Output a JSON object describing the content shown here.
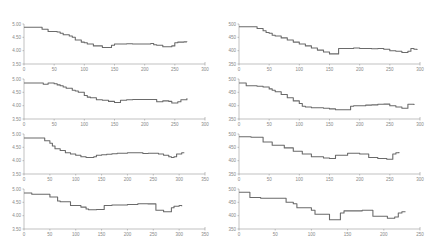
{
  "chart_data": [
    {
      "type": "line",
      "title": "",
      "xlabel": "",
      "ylabel": "",
      "xlim": [
        0,
        300
      ],
      "ylim": [
        3.5,
        5.0
      ],
      "xticks": [
        "0",
        "50",
        "100",
        "150",
        "200",
        "250",
        "300"
      ],
      "yticks": [
        "5.00",
        "4.50",
        "4.00",
        "3.50"
      ],
      "grid": false,
      "series": [
        {
          "name": "series",
          "x": [
            0,
            10,
            20,
            25,
            30,
            35,
            40,
            50,
            55,
            60,
            65,
            70,
            75,
            80,
            85,
            90,
            95,
            100,
            105,
            110,
            115,
            120,
            130,
            140,
            145,
            150,
            155,
            160,
            170,
            180,
            190,
            200,
            210,
            215,
            220,
            225,
            230,
            240,
            245,
            250,
            255,
            260,
            265,
            270
          ],
          "y": [
            4.88,
            4.88,
            4.88,
            4.88,
            4.8,
            4.8,
            4.72,
            4.72,
            4.7,
            4.65,
            4.6,
            4.6,
            4.55,
            4.5,
            4.4,
            4.4,
            4.32,
            4.3,
            4.25,
            4.25,
            4.18,
            4.18,
            4.12,
            4.12,
            4.2,
            4.25,
            4.25,
            4.25,
            4.26,
            4.25,
            4.25,
            4.25,
            4.27,
            4.22,
            4.2,
            4.2,
            4.15,
            4.15,
            4.18,
            4.3,
            4.32,
            4.32,
            4.33,
            4.32
          ]
        }
      ]
    },
    {
      "type": "line",
      "title": "",
      "xlabel": "",
      "ylabel": "",
      "xlim": [
        0,
        300
      ],
      "ylim": [
        350,
        500
      ],
      "xticks": [
        "0",
        "50",
        "100",
        "150",
        "200",
        "250",
        "300"
      ],
      "yticks": [
        "500",
        "450",
        "400",
        "350"
      ],
      "grid": false,
      "series": [
        {
          "name": "series",
          "x": [
            0,
            15,
            25,
            30,
            35,
            40,
            45,
            50,
            55,
            60,
            70,
            80,
            90,
            100,
            110,
            120,
            130,
            140,
            150,
            160,
            165,
            180,
            190,
            200,
            210,
            220,
            230,
            240,
            250,
            260,
            270,
            275,
            280,
            285,
            290,
            295
          ],
          "y": [
            490,
            490,
            490,
            483,
            483,
            475,
            468,
            465,
            458,
            455,
            448,
            440,
            432,
            425,
            418,
            410,
            402,
            395,
            388,
            388,
            408,
            408,
            410,
            408,
            408,
            407,
            408,
            405,
            400,
            398,
            393,
            393,
            398,
            408,
            405,
            402
          ]
        }
      ]
    },
    {
      "type": "line",
      "title": "",
      "xlabel": "",
      "ylabel": "",
      "xlim": [
        0,
        300
      ],
      "ylim": [
        3.5,
        5.0
      ],
      "xticks": [
        "0",
        "50",
        "100",
        "150",
        "200",
        "250",
        "300"
      ],
      "yticks": [
        "5.00",
        "4.50",
        "4.00",
        "3.50"
      ],
      "grid": false,
      "series": [
        {
          "name": "series",
          "x": [
            0,
            10,
            20,
            30,
            32,
            40,
            50,
            55,
            60,
            65,
            70,
            80,
            85,
            90,
            100,
            105,
            110,
            120,
            130,
            140,
            150,
            155,
            160,
            170,
            180,
            190,
            200,
            210,
            220,
            230,
            240,
            245,
            250,
            255,
            260,
            270
          ],
          "y": [
            4.85,
            4.85,
            4.85,
            4.85,
            4.8,
            4.85,
            4.82,
            4.78,
            4.75,
            4.7,
            4.65,
            4.58,
            4.55,
            4.5,
            4.38,
            4.32,
            4.3,
            4.22,
            4.2,
            4.16,
            4.12,
            4.12,
            4.2,
            4.22,
            4.23,
            4.23,
            4.23,
            4.23,
            4.15,
            4.18,
            4.16,
            4.1,
            4.1,
            4.15,
            4.22,
            4.28
          ]
        }
      ]
    },
    {
      "type": "line",
      "title": "",
      "xlabel": "",
      "ylabel": "",
      "xlim": [
        0,
        300
      ],
      "ylim": [
        350,
        500
      ],
      "xticks": [
        "0",
        "50",
        "100",
        "150",
        "200",
        "250",
        "300"
      ],
      "yticks": [
        "500",
        "450",
        "400",
        "350"
      ],
      "grid": false,
      "series": [
        {
          "name": "series",
          "x": [
            0,
            5,
            10,
            12,
            20,
            30,
            40,
            50,
            55,
            60,
            70,
            80,
            90,
            100,
            105,
            110,
            120,
            130,
            140,
            150,
            160,
            170,
            180,
            185,
            190,
            200,
            210,
            220,
            230,
            240,
            250,
            260,
            270,
            275,
            280,
            285,
            290
          ],
          "y": [
            485,
            485,
            485,
            475,
            475,
            473,
            470,
            463,
            458,
            452,
            442,
            430,
            418,
            408,
            398,
            395,
            392,
            392,
            390,
            388,
            385,
            385,
            385,
            398,
            400,
            400,
            402,
            403,
            405,
            406,
            400,
            395,
            390,
            390,
            405,
            405,
            402
          ]
        }
      ]
    },
    {
      "type": "line",
      "title": "",
      "xlabel": "",
      "ylabel": "",
      "xlim": [
        0,
        350
      ],
      "ylim": [
        3.5,
        5.0
      ],
      "xticks": [
        "0",
        "50",
        "100",
        "150",
        "200",
        "250",
        "300",
        "350"
      ],
      "yticks": [
        "5.00",
        "4.50",
        "4.00",
        "3.50"
      ],
      "grid": false,
      "series": [
        {
          "name": "series",
          "x": [
            0,
            20,
            30,
            35,
            40,
            50,
            55,
            60,
            70,
            80,
            90,
            100,
            110,
            120,
            125,
            135,
            140,
            150,
            160,
            170,
            180,
            200,
            220,
            230,
            240,
            250,
            260,
            270,
            280,
            285,
            290,
            295,
            300,
            305,
            310
          ],
          "y": [
            4.85,
            4.85,
            4.85,
            4.85,
            4.75,
            4.65,
            4.55,
            4.45,
            4.38,
            4.3,
            4.25,
            4.2,
            4.15,
            4.12,
            4.12,
            4.15,
            4.2,
            4.22,
            4.24,
            4.26,
            4.28,
            4.3,
            4.3,
            4.27,
            4.28,
            4.28,
            4.25,
            4.2,
            4.15,
            4.12,
            4.15,
            4.25,
            4.25,
            4.3,
            4.3
          ]
        }
      ]
    },
    {
      "type": "line",
      "title": "",
      "xlabel": "",
      "ylabel": "",
      "xlim": [
        0,
        300
      ],
      "ylim": [
        350,
        500
      ],
      "xticks": [
        "0",
        "50",
        "100",
        "150",
        "200",
        "250",
        "300"
      ],
      "yticks": [
        "500",
        "450",
        "400",
        "350"
      ],
      "grid": false,
      "series": [
        {
          "name": "series",
          "x": [
            0,
            15,
            20,
            35,
            40,
            50,
            55,
            70,
            75,
            80,
            90,
            95,
            105,
            110,
            120,
            125,
            140,
            145,
            150,
            155,
            160,
            170,
            180,
            190,
            200,
            205,
            215,
            220,
            230,
            240,
            245,
            250,
            255,
            260,
            265
          ],
          "y": [
            490,
            490,
            488,
            488,
            470,
            470,
            458,
            458,
            448,
            448,
            435,
            435,
            425,
            425,
            415,
            415,
            410,
            410,
            408,
            408,
            420,
            420,
            428,
            428,
            425,
            425,
            412,
            412,
            408,
            408,
            405,
            405,
            425,
            430,
            432
          ]
        }
      ]
    },
    {
      "type": "line",
      "title": "",
      "xlabel": "",
      "ylabel": "",
      "xlim": [
        0,
        350
      ],
      "ylim": [
        3.5,
        5.0
      ],
      "xticks": [
        "0",
        "50",
        "100",
        "150",
        "200",
        "250",
        "300",
        "350"
      ],
      "yticks": [
        "5.00",
        "4.50",
        "4.00",
        "3.50"
      ],
      "grid": false,
      "series": [
        {
          "name": "series",
          "x": [
            0,
            10,
            15,
            45,
            50,
            60,
            65,
            70,
            80,
            90,
            95,
            105,
            110,
            120,
            125,
            130,
            135,
            140,
            150,
            155,
            160,
            170,
            200,
            220,
            240,
            250,
            255,
            265,
            270,
            280,
            285,
            290,
            300,
            305
          ],
          "y": [
            4.85,
            4.85,
            4.8,
            4.8,
            4.7,
            4.7,
            4.55,
            4.52,
            4.52,
            4.38,
            4.38,
            4.38,
            4.32,
            4.25,
            4.22,
            4.22,
            4.22,
            4.23,
            4.23,
            4.38,
            4.38,
            4.4,
            4.42,
            4.45,
            4.44,
            4.44,
            4.2,
            4.2,
            4.15,
            4.15,
            4.3,
            4.35,
            4.38,
            4.35
          ]
        }
      ]
    },
    {
      "type": "line",
      "title": "",
      "xlabel": "",
      "ylabel": "",
      "xlim": [
        0,
        250
      ],
      "ylim": [
        350,
        500
      ],
      "xticks": [
        "0",
        "50",
        "100",
        "150",
        "200",
        "250"
      ],
      "yticks": [
        "500",
        "450",
        "400",
        "350"
      ],
      "grid": false,
      "series": [
        {
          "name": "series",
          "x": [
            0,
            10,
            15,
            25,
            30,
            50,
            60,
            65,
            70,
            75,
            80,
            90,
            95,
            100,
            105,
            110,
            120,
            125,
            130,
            135,
            140,
            145,
            150,
            160,
            170,
            180,
            185,
            190,
            200,
            205,
            210,
            215,
            220,
            225,
            230
          ],
          "y": [
            488,
            488,
            468,
            468,
            465,
            465,
            465,
            450,
            450,
            445,
            430,
            430,
            430,
            420,
            405,
            405,
            405,
            385,
            385,
            385,
            410,
            418,
            418,
            418,
            420,
            420,
            398,
            398,
            398,
            390,
            390,
            395,
            410,
            415,
            415
          ]
        }
      ]
    }
  ]
}
